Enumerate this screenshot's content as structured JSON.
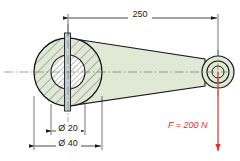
{
  "drawing": {
    "title": "Lever with applied force",
    "type": "mechanical-engineering-section-drawing",
    "background_color": "#ffffff",
    "body_fill_color": "#dfe9d5",
    "bore_fill_color": "#ffffff",
    "slot_fill_color": "#cfdde2",
    "outline_color": "#1a1a1a",
    "hatch_color": "#3c3c3c",
    "centerline_color": "#6f7f6f",
    "force_color": "#e03030"
  },
  "dimensions": {
    "length": {
      "label": "250",
      "value": 250,
      "unit": "mm",
      "orientation": "horizontal",
      "from_x": 68,
      "to_x": 218,
      "line_y": 18
    },
    "bore_diameter": {
      "label": "Ø 20",
      "value": 20,
      "unit": "mm",
      "orientation": "horizontal",
      "from_x": 51,
      "to_x": 85,
      "line_y": 131
    },
    "hub_diameter": {
      "label": "Ø 40",
      "value": 40,
      "unit": "mm",
      "orientation": "horizontal",
      "from_x": 34,
      "to_x": 102,
      "line_y": 146
    }
  },
  "force": {
    "label": "F = 200 N",
    "symbol": "F",
    "value": 200,
    "unit": "N",
    "direction": "down",
    "color": "#e03030",
    "origin_x": 218,
    "origin_y": 72,
    "tip_y": 152,
    "text_x": 168,
    "text_y": 125
  },
  "geometry": {
    "hub": {
      "center_x": 68,
      "center_y": 72,
      "outer_radius": 34,
      "bore_radius": 17
    },
    "eye": {
      "center_x": 218,
      "center_y": 72,
      "outer_radius": 16,
      "mid_radius": 11,
      "hole_radius": 6
    },
    "slot": {
      "x": 64,
      "width": 6,
      "top_y": 32,
      "bottom_y": 112
    },
    "centerline_y": 72
  }
}
